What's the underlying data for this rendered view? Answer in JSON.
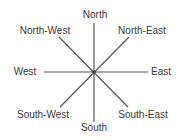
{
  "diagram": {
    "type": "compass-rose",
    "center": {
      "x": 94,
      "y": 72
    },
    "line_color": "#555555",
    "text_color": "#3a3a3a",
    "lines": [
      {
        "name": "north-south-line",
        "x1": 94,
        "y1": 23,
        "x2": 94,
        "y2": 122
      },
      {
        "name": "west-east-line",
        "x1": 44,
        "y1": 72,
        "x2": 148,
        "y2": 72
      },
      {
        "name": "northwest-southeast-line",
        "x1": 59,
        "y1": 37,
        "x2": 128,
        "y2": 107
      },
      {
        "name": "northeast-southwest-line",
        "x1": 129,
        "y1": 37,
        "x2": 60,
        "y2": 107
      }
    ],
    "labels": {
      "north": "North",
      "north_east": "North-East",
      "east": "East",
      "south_east": "South-East",
      "south": "South",
      "south_west": "South-West",
      "west": "West",
      "north_west": "North-West"
    }
  }
}
